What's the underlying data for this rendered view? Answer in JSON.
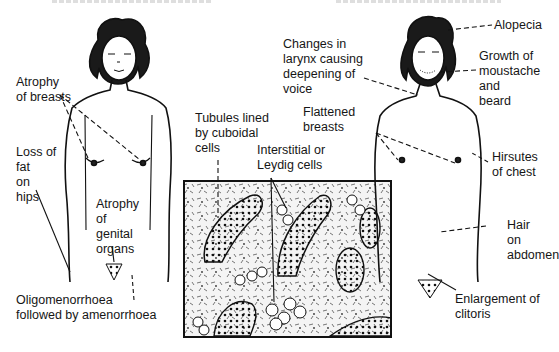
{
  "figure": {
    "headers": {
      "left": {
        "cropped": true,
        "text": ""
      },
      "right": {
        "cropped": true,
        "text": ""
      }
    },
    "left_figure": {
      "subject": "female figure",
      "labels": [
        {
          "id": "atrophy-breasts",
          "lines": [
            "Atrophy",
            "of breasts"
          ]
        },
        {
          "id": "loss-fat-hips",
          "lines": [
            "Loss of",
            "fat",
            "on",
            "hips"
          ]
        },
        {
          "id": "atrophy-genital",
          "lines": [
            "Atrophy",
            "of",
            "genital",
            "organs"
          ]
        },
        {
          "id": "oligomenorrhoea",
          "lines": [
            "Oligomenorrhoea",
            "followed by amenorrhoea"
          ]
        }
      ]
    },
    "histology": {
      "labels": [
        {
          "id": "tubules",
          "lines": [
            "Tubules lined",
            "by cuboidal",
            "cells"
          ]
        },
        {
          "id": "leydig",
          "lines": [
            "Interstitial or",
            "Leydig cells"
          ]
        }
      ]
    },
    "right_figure": {
      "subject": "virilised figure",
      "labels": [
        {
          "id": "alopecia",
          "lines": [
            "Alopecia"
          ]
        },
        {
          "id": "larynx",
          "lines": [
            "Changes in",
            "larynx causing",
            "deepening of",
            "voice"
          ]
        },
        {
          "id": "moustache",
          "lines": [
            "Growth of",
            "moustache",
            "and",
            "beard"
          ]
        },
        {
          "id": "flattened",
          "lines": [
            "Flattened",
            "breasts"
          ]
        },
        {
          "id": "hirsutes",
          "lines": [
            "Hirsutes",
            "of chest"
          ]
        },
        {
          "id": "hair-abdomen",
          "lines": [
            "Hair",
            "on",
            "abdomen"
          ]
        },
        {
          "id": "clitoris",
          "lines": [
            "Enlargement of",
            "clitoris"
          ]
        }
      ]
    }
  }
}
